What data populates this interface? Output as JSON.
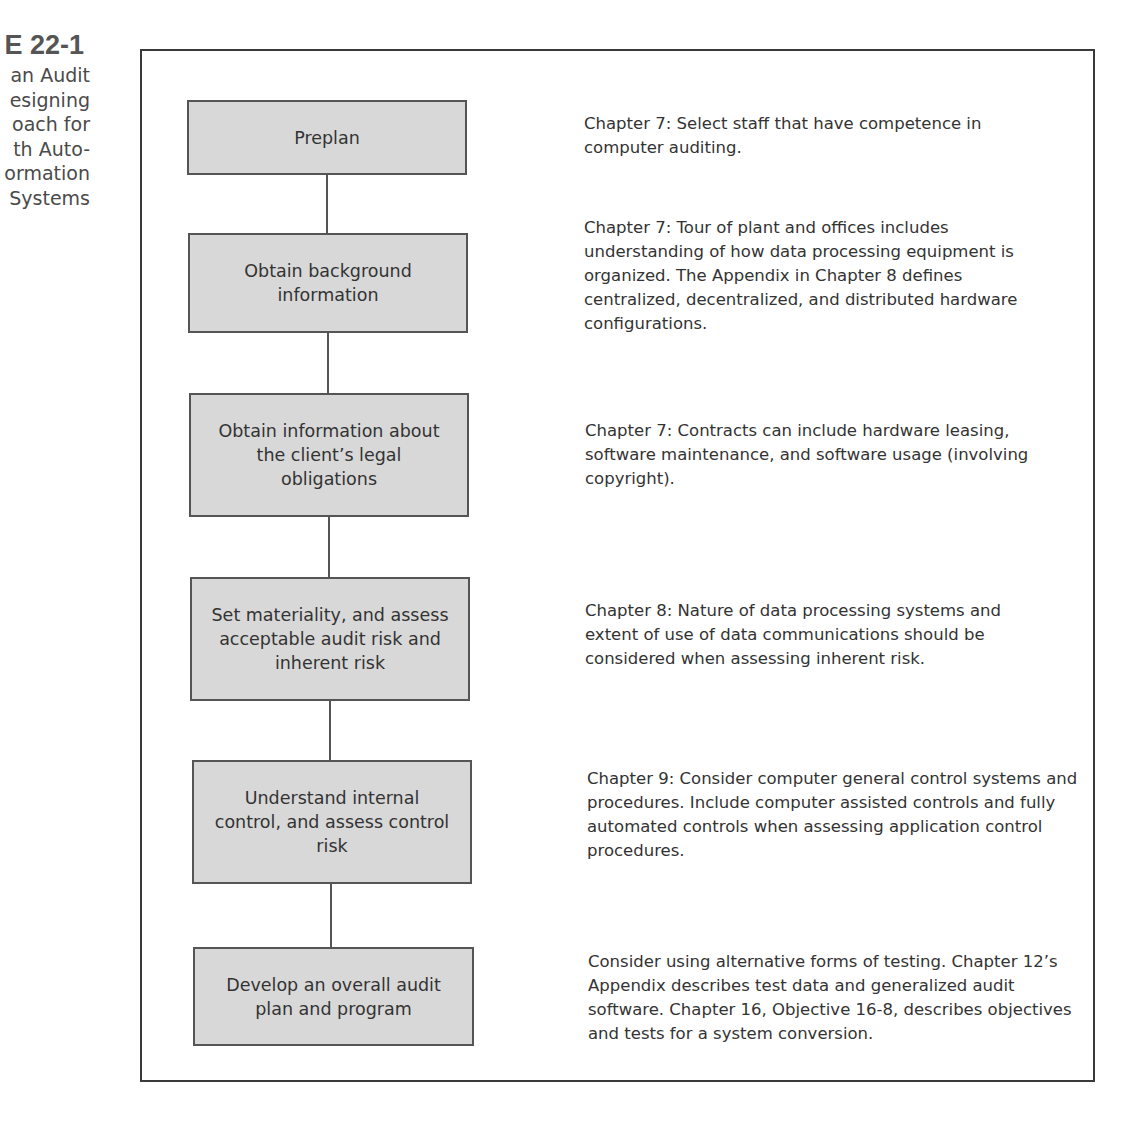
{
  "caption": {
    "figure_number": "E 22-1",
    "lines": [
      "an Audit",
      "esigning",
      "oach for",
      "th Auto-",
      "ormation",
      "Systems"
    ]
  },
  "flowchart": {
    "steps": [
      {
        "label": "Preplan",
        "note": "Chapter 7: Select staff that have competence in computer auditing."
      },
      {
        "label": "Obtain background information",
        "note": "Chapter 7: Tour of plant and offices includes understanding of how data processing equipment is organized. The Appendix in Chapter 8 defines centralized, decentralized, and distributed hardware configurations."
      },
      {
        "label": "Obtain information about the client’s legal obligations",
        "note": "Chapter 7: Contracts can include hardware leasing, software maintenance, and software usage (involving copyright)."
      },
      {
        "label": "Set materiality, and assess acceptable audit risk and inherent risk",
        "note": "Chapter 8: Nature of data processing systems and extent of use of data communications should be considered when assessing inherent risk."
      },
      {
        "label": "Understand internal control, and assess control risk",
        "note": "Chapter 9: Consider computer general control systems and procedures. Include computer assisted controls and fully automated controls when assessing application control procedures."
      },
      {
        "label": "Develop an overall audit plan and program",
        "note": "Consider using alternative forms of testing. Chapter 12’s Appendix describes test data and generalized audit software. Chapter 16, Objective 16-8, describes objectives and tests for a system conversion."
      }
    ]
  },
  "colors": {
    "box_fill": "#d8d8d8",
    "box_border": "#555555",
    "frame_border": "#3a3a3a",
    "text": "#333333"
  }
}
